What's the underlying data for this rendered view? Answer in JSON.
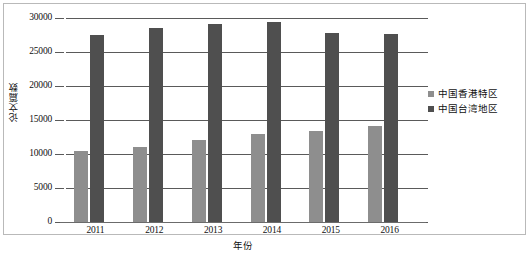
{
  "chart_data": {
    "type": "bar",
    "title": "",
    "subtitle": "",
    "xlabel": "年份",
    "ylabel": "论文篇数",
    "categories": [
      "2011",
      "2012",
      "2013",
      "2014",
      "2015",
      "2016"
    ],
    "series": [
      {
        "name": "中国香港特区",
        "color": "#8e8e8e",
        "values": [
          10500,
          11100,
          12100,
          12900,
          13400,
          14100
        ]
      },
      {
        "name": "中国台湾地区",
        "color": "#4f4f4f",
        "values": [
          27500,
          28600,
          29100,
          29400,
          27800,
          27700
        ]
      }
    ],
    "ylim": [
      0,
      30000
    ],
    "yticks": [
      0,
      5000,
      10000,
      15000,
      20000,
      25000,
      30000
    ],
    "ytick_labels": [
      "0",
      "5000",
      "10000",
      "15000",
      "20000",
      "25000",
      "30000"
    ],
    "grid": true,
    "grid_axis": "y",
    "legend_position": "right",
    "legend": [
      "中国香港特区",
      "中国台湾地区"
    ],
    "bar_orientation": "vertical"
  },
  "axes": {
    "y_title": "论文篇数",
    "x_title": "年份"
  },
  "legend_items": [
    {
      "label": "中国香港特区"
    },
    {
      "label": "中国台湾地区"
    }
  ],
  "ticks": {
    "y": [
      "30000",
      "25000",
      "20000",
      "15000",
      "10000",
      "5000",
      "0"
    ],
    "x": [
      "2011",
      "2012",
      "2013",
      "2014",
      "2015",
      "2016"
    ]
  }
}
